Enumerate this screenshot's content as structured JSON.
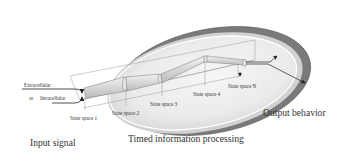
{
  "diagram": {
    "type": "process-flow",
    "labels": {
      "input_signal": "Input signal",
      "timed_processing": "Timed information processing",
      "output_behavior": "Output behavior",
      "extracellular": "Extracellular",
      "or": "or",
      "intracellular": "Intracellular"
    },
    "state_spaces": [
      {
        "label": "State space 1"
      },
      {
        "label": "State space 2"
      },
      {
        "label": "State space 3"
      },
      {
        "label": "State space 4"
      },
      {
        "label": "State space N"
      }
    ],
    "colors": {
      "ellipse_fill": "#ececec",
      "ellipse_rim": "#6e6e6e",
      "ellipse_highlight": "#ffffff",
      "tube_fill": "#d9d9d9",
      "line": "#555555",
      "arrow": "#222222"
    }
  }
}
